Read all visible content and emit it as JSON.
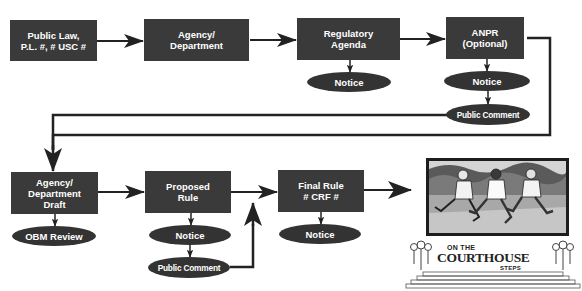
{
  "diagram": {
    "colors": {
      "node_fill": "#3a3a3a",
      "ellipse_fill": "#333333",
      "text": "#ffffff",
      "line": "#222222",
      "background": "#ffffff"
    },
    "top_row": [
      {
        "id": "public-law",
        "label_lines": [
          "Public Law,",
          "P.L. #, # USC #"
        ]
      },
      {
        "id": "agency",
        "label_lines": [
          "Agency/",
          "Department"
        ]
      },
      {
        "id": "regulatory-agenda",
        "label_lines": [
          "Regulatory",
          "Agenda"
        ]
      },
      {
        "id": "anpr",
        "label_lines": [
          "ANPR",
          "(Optional)"
        ]
      }
    ],
    "top_ellipses": [
      {
        "id": "reg-notice",
        "label": "Notice",
        "attached_to": "regulatory-agenda"
      },
      {
        "id": "anpr-notice",
        "label": "Notice",
        "attached_to": "anpr"
      },
      {
        "id": "anpr-public-comment",
        "label": "Public Comment",
        "attached_to": "anpr-notice"
      }
    ],
    "bottom_row": [
      {
        "id": "draft",
        "label_lines": [
          "Agency/",
          "Department",
          "Draft"
        ]
      },
      {
        "id": "proposed-rule",
        "label_lines": [
          "Proposed",
          "Rule"
        ]
      },
      {
        "id": "final-rule",
        "label_lines": [
          "Final Rule",
          "# CRF #"
        ]
      }
    ],
    "bottom_ellipses": [
      {
        "id": "obm-review",
        "label": "OBM Review",
        "attached_to": "draft"
      },
      {
        "id": "proposed-notice",
        "label": "Notice",
        "attached_to": "proposed-rule"
      },
      {
        "id": "proposed-public-comment",
        "label": "Public Comment",
        "attached_to": "proposed-notice"
      },
      {
        "id": "final-notice",
        "label": "Notice",
        "attached_to": "final-rule"
      }
    ],
    "edges": [
      [
        "public-law",
        "agency"
      ],
      [
        "agency",
        "regulatory-agenda"
      ],
      [
        "regulatory-agenda",
        "anpr"
      ],
      [
        "regulatory-agenda",
        "reg-notice"
      ],
      [
        "anpr",
        "anpr-notice"
      ],
      [
        "anpr-notice",
        "anpr-public-comment"
      ],
      [
        "anpr",
        "draft"
      ],
      [
        "anpr-public-comment",
        "draft"
      ],
      [
        "draft",
        "obm-review"
      ],
      [
        "draft",
        "proposed-rule"
      ],
      [
        "proposed-rule",
        "proposed-notice"
      ],
      [
        "proposed-notice",
        "proposed-public-comment"
      ],
      [
        "proposed-rule",
        "final-rule"
      ],
      [
        "proposed-public-comment",
        "final-rule"
      ],
      [
        "final-rule",
        "final-notice"
      ],
      [
        "final-rule",
        "courthouse-steps"
      ]
    ],
    "logo": {
      "line1": "ON THE",
      "line2": "COURTHOUSE",
      "line3": "STEPS",
      "image_description": "three runners illustration"
    }
  }
}
